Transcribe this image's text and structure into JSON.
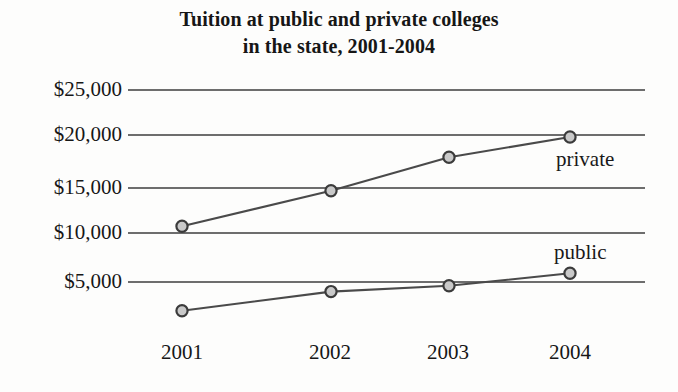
{
  "chart_data": {
    "type": "line",
    "title": "Tuition at public and private colleges in the state, 2001-2004",
    "title_lines": [
      "Tuition at public and private colleges",
      "in the state, 2001-2004"
    ],
    "xlabel": "",
    "ylabel": "",
    "categories": [
      "2001",
      "2002",
      "2003",
      "2004"
    ],
    "x_tick_labels": [
      "2001",
      "2002",
      "2003",
      "2004"
    ],
    "y_tick_labels": [
      "$25,000",
      "$20,000",
      "$15,000",
      "$10,000",
      "$5,000"
    ],
    "y_tick_values": [
      25000,
      20000,
      15000,
      10000,
      5000
    ],
    "ylim": [
      0,
      26500
    ],
    "grid": "horizontal",
    "legend_position": "inline-annotations",
    "series": [
      {
        "name": "private",
        "label": "private",
        "values": [
          10700,
          14400,
          17900,
          20000
        ],
        "marker": "circle",
        "color": "#4a4a4a"
      },
      {
        "name": "public",
        "label": "public",
        "values": [
          1900,
          3900,
          4500,
          5800
        ],
        "marker": "circle",
        "color": "#4a4a4a"
      }
    ],
    "annotations": [
      {
        "text": "private",
        "series": "private"
      },
      {
        "text": "public",
        "series": "public"
      }
    ],
    "colors": {
      "background": "#fdfdfc",
      "gridline": "#6d6d6d",
      "line": "#4a4a4a",
      "marker_fill": "#c9c9c9",
      "marker_stroke": "#3b3b3b",
      "text": "#171717"
    }
  }
}
